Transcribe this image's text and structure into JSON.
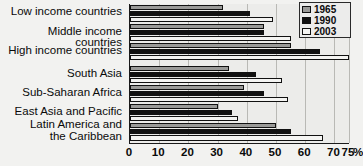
{
  "chart_data": {
    "type": "bar",
    "orientation": "horizontal",
    "title": "",
    "xlabel": "%",
    "ylabel": "",
    "xlim": [
      0,
      75
    ],
    "grid": true,
    "legend_position": "top-right",
    "xticks": [
      "0",
      "10",
      "20",
      "30",
      "40",
      "50",
      "60",
      "70",
      "75"
    ],
    "xtick_values": [
      0,
      10,
      20,
      30,
      40,
      50,
      60,
      70,
      75
    ],
    "unit_label": "%",
    "categories": [
      "Low income countries",
      "Middle income countries",
      "High income countries",
      "South Asia",
      "Sub-Saharan Africa",
      "East Asia and Pacific",
      "Latin America and\nthe Caribbean"
    ],
    "series": [
      {
        "name": "1965",
        "color": "#9a9a98",
        "values": [
          32,
          46,
          55,
          34,
          39,
          30,
          50
        ]
      },
      {
        "name": "1990",
        "color": "#111111",
        "values": [
          41,
          46,
          65,
          43,
          46,
          35,
          55
        ]
      },
      {
        "name": "2003",
        "color": "#f4f4f2",
        "values": [
          49,
          55,
          75,
          52,
          54,
          37,
          66
        ]
      }
    ]
  },
  "legend": {
    "items": [
      {
        "label": "1965",
        "swatch": "#9a9a98"
      },
      {
        "label": "1990",
        "swatch": "#111111"
      },
      {
        "label": "2003",
        "swatch": "#f4f4f2"
      }
    ]
  }
}
